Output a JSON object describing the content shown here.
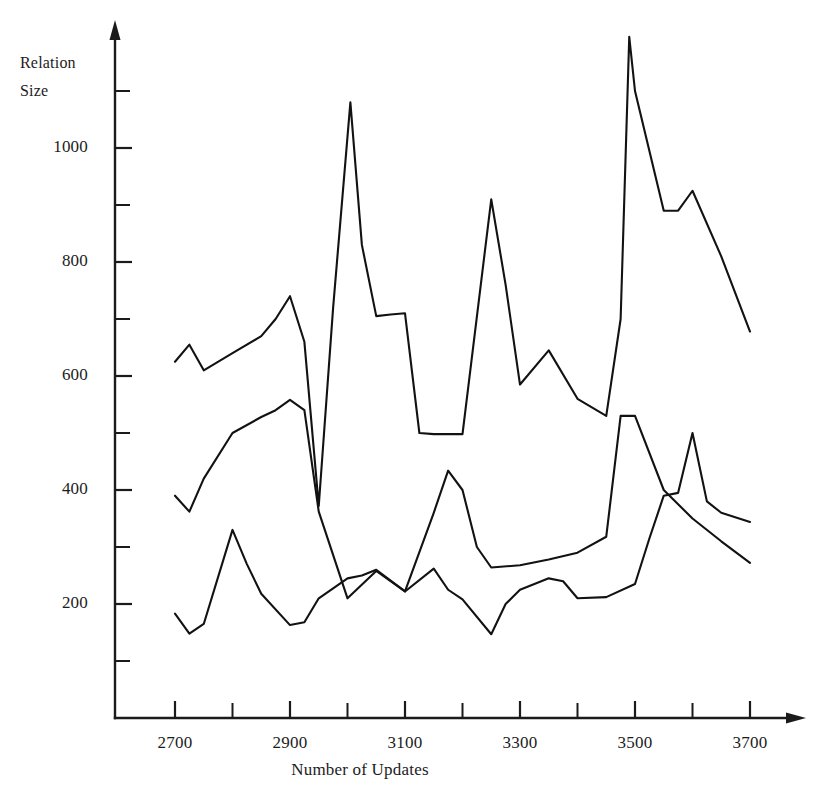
{
  "chart_data": {
    "type": "line",
    "title": "",
    "xlabel": "Number of Updates",
    "ylabel": "Relation Size",
    "ylabel_lines": [
      "Relation",
      "Size"
    ],
    "xlim": [
      2650,
      3720
    ],
    "ylim": [
      0,
      1200
    ],
    "grid": false,
    "legend": null,
    "x_major_ticks": [
      2700,
      2900,
      3100,
      3300,
      3500,
      3700
    ],
    "x_minor_ticks": [
      2800,
      3000,
      3200,
      3400,
      3600
    ],
    "x_tick_labels": [
      "2700",
      "2900",
      "3100",
      "3300",
      "3500",
      "3700"
    ],
    "y_major_ticks": [
      200,
      400,
      600,
      800,
      1000
    ],
    "y_minor_ticks": [
      100,
      300,
      500,
      700,
      900,
      1100
    ],
    "y_tick_labels": [
      "200",
      "400",
      "600",
      "800",
      "1000"
    ],
    "axis_color": "#1b1b1b",
    "line_color": "#121212",
    "series": [
      {
        "name": "upper-curve",
        "x": [
          2700,
          2725,
          2750,
          2800,
          2850,
          2875,
          2900,
          2925,
          2950,
          2975,
          3000,
          3005,
          3025,
          3050,
          3075,
          3100,
          3125,
          3150,
          3175,
          3200,
          3250,
          3275,
          3300,
          3350,
          3400,
          3450,
          3475,
          3490,
          3500,
          3550,
          3575,
          3600,
          3650,
          3700
        ],
        "y": [
          625,
          655,
          610,
          640,
          670,
          700,
          740,
          660,
          372,
          720,
          1020,
          1080,
          830,
          705,
          708,
          710,
          500,
          498,
          498,
          498,
          910,
          760,
          585,
          645,
          560,
          530,
          700,
          1195,
          1100,
          890,
          890,
          925,
          810,
          678
        ]
      },
      {
        "name": "middle-curve",
        "x": [
          2700,
          2725,
          2750,
          2800,
          2850,
          2875,
          2900,
          2925,
          2950,
          3000,
          3050,
          3100,
          3150,
          3175,
          3200,
          3225,
          3250,
          3300,
          3350,
          3400,
          3450,
          3475,
          3500,
          3550,
          3600,
          3650,
          3700
        ],
        "y": [
          390,
          362,
          420,
          500,
          528,
          540,
          558,
          540,
          362,
          210,
          258,
          222,
          360,
          434,
          400,
          300,
          264,
          268,
          278,
          290,
          318,
          530,
          530,
          400,
          350,
          310,
          272
        ]
      },
      {
        "name": "lower-curve",
        "x": [
          2700,
          2725,
          2750,
          2800,
          2825,
          2850,
          2900,
          2925,
          2950,
          3000,
          3025,
          3050,
          3100,
          3150,
          3175,
          3200,
          3250,
          3275,
          3300,
          3350,
          3375,
          3400,
          3450,
          3500,
          3525,
          3550,
          3575,
          3600,
          3625,
          3650,
          3700
        ],
        "y": [
          183,
          148,
          165,
          330,
          270,
          218,
          163,
          168,
          210,
          245,
          250,
          260,
          222,
          262,
          225,
          208,
          147,
          200,
          225,
          245,
          240,
          210,
          212,
          235,
          315,
          390,
          395,
          500,
          380,
          360,
          344
        ]
      }
    ]
  },
  "axis_labels": {
    "y_title_line1": "Relation",
    "y_title_line2": "Size",
    "x_title": "Number of Updates"
  }
}
